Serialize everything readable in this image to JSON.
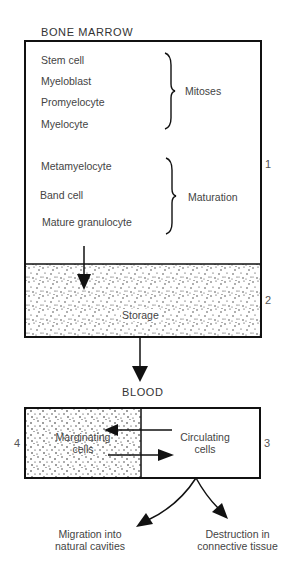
{
  "diagram": {
    "bone_marrow": {
      "title": "BONE MARROW",
      "compartment_number": "1",
      "mitoses_group": {
        "label": "Mitoses",
        "cells": [
          "Stem cell",
          "Myeloblast",
          "Promyelocyte",
          "Myelocyte"
        ]
      },
      "maturation_group": {
        "label": "Maturation",
        "cells": [
          "Metamyelocyte",
          "Band cell",
          "Mature granulocyte"
        ]
      },
      "storage": {
        "label": "Storage",
        "compartment_number": "2"
      }
    },
    "blood": {
      "title": "BLOOD",
      "marginating": {
        "label_line1": "Marginating",
        "label_line2": "cells",
        "compartment_number": "4"
      },
      "circulating": {
        "label_line1": "Circulating",
        "label_line2": "cells",
        "compartment_number": "3"
      }
    },
    "outflows": {
      "left": {
        "line1": "Migration into",
        "line2": "natural cavities"
      },
      "right": {
        "line1": "Destruction in",
        "line2": "connective tissue"
      }
    },
    "colors": {
      "stroke": "#111111",
      "text": "#444444",
      "stipple": "#222222"
    }
  }
}
